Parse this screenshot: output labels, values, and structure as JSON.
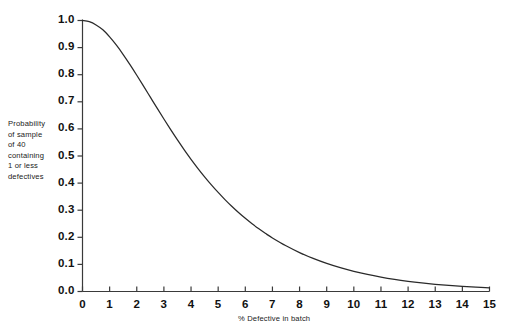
{
  "chart_data": {
    "type": "line",
    "title": "",
    "subtitle": "",
    "xlabel": "% Defective in batch",
    "ylabel": "Probability of sample of 40 containing 1 or less defectives",
    "ylabel_lines": [
      "Probability",
      "of sample",
      "of 40",
      "containing",
      "1 or less",
      "defectives"
    ],
    "xlim": [
      0,
      15
    ],
    "ylim": [
      0,
      1
    ],
    "grid": false,
    "legend": null,
    "legend_position": "none",
    "xticks": [
      0,
      1,
      2,
      3,
      4,
      5,
      6,
      7,
      8,
      9,
      10,
      11,
      12,
      13,
      14,
      15
    ],
    "xtick_labels": [
      "0",
      "1",
      "2",
      "3",
      "4",
      "5",
      "6",
      "7",
      "8",
      "9",
      "10",
      "11",
      "12",
      "13",
      "14",
      "15"
    ],
    "yticks": [
      0.0,
      0.1,
      0.2,
      0.3,
      0.4,
      0.5,
      0.6,
      0.7,
      0.8,
      0.9,
      1.0
    ],
    "ytick_labels": [
      "0.0",
      "0.1",
      "0.2",
      "0.3",
      "0.4",
      "0.5",
      "0.6",
      "0.7",
      "0.8",
      "0.9",
      "1.0"
    ],
    "line_color": "#2a2a2a",
    "axis_color": "#3a3a3a",
    "series": [
      {
        "name": "P(1 or less defectives in sample of 40)",
        "x": [
          0.0,
          0.25,
          0.5,
          0.75,
          1.0,
          1.25,
          1.5,
          1.75,
          2.0,
          2.25,
          2.5,
          2.75,
          3.0,
          3.25,
          3.5,
          3.75,
          4.0,
          4.25,
          4.5,
          4.75,
          5.0,
          5.25,
          5.5,
          5.75,
          6.0,
          6.25,
          6.5,
          6.75,
          7.0,
          7.5,
          8.0,
          8.5,
          9.0,
          9.5,
          10.0,
          10.5,
          11.0,
          11.5,
          12.0,
          12.5,
          13.0,
          13.5,
          14.0,
          14.5,
          15.0
        ],
        "y": [
          1.0,
          0.9956,
          0.9837,
          0.9656,
          0.9393,
          0.9088,
          0.8744,
          0.8372,
          0.7981,
          0.7578,
          0.7171,
          0.6765,
          0.6364,
          0.5972,
          0.5593,
          0.5228,
          0.4879,
          0.4547,
          0.4232,
          0.3935,
          0.3655,
          0.3392,
          0.3146,
          0.2915,
          0.27,
          0.2499,
          0.2312,
          0.2138,
          0.1976,
          0.1686,
          0.1436,
          0.1221,
          0.1036,
          0.0878,
          0.0744,
          0.0629,
          0.0531,
          0.0448,
          0.0378,
          0.0318,
          0.0267,
          0.0224,
          0.0188,
          0.0158,
          0.0132
        ]
      }
    ],
    "annotations": []
  }
}
